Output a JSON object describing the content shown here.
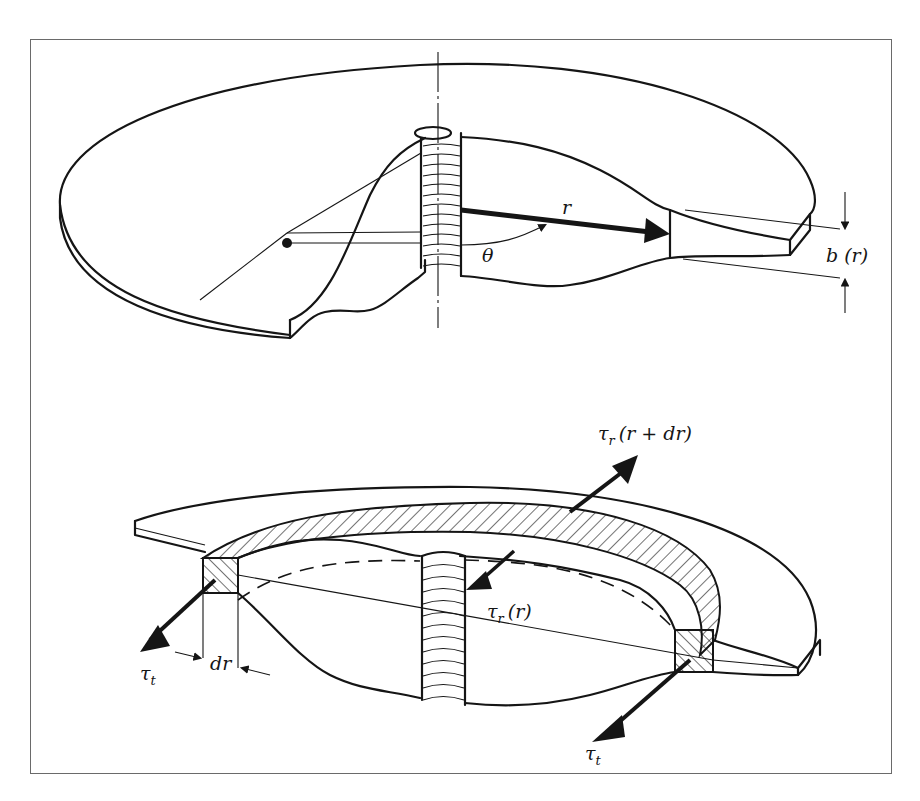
{
  "figure": {
    "upper_diagram": {
      "description": "Rotating disk of variable thickness with cut-away section",
      "labels": {
        "radius": "r",
        "angle": "θ",
        "thickness": "b (r)"
      }
    },
    "lower_diagram": {
      "description": "Ring element of width dr showing stresses",
      "labels": {
        "radial_stress_outer": "τr (r + dr)",
        "radial_stress_outer_main": "τ",
        "radial_stress_outer_sub": "r",
        "radial_stress_outer_arg": "(r + dr)",
        "radial_stress_inner_main": "τ",
        "radial_stress_inner_sub": "r",
        "radial_stress_inner_arg": "(r)",
        "tangential_stress_left_main": "τ",
        "tangential_stress_left_sub": "t",
        "tangential_stress_right_main": "τ",
        "tangential_stress_right_sub": "t",
        "ring_width": "dr"
      }
    },
    "colors": {
      "ink": "#151515",
      "frame": "#6a6a6a",
      "background": "#ffffff"
    }
  }
}
